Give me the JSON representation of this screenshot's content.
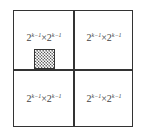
{
  "diagram": {
    "cells": [
      {
        "position": "top-left",
        "base1": "2",
        "exp1": "k−1",
        "times": "×",
        "base2": "2",
        "exp2": "k−1"
      },
      {
        "position": "top-right",
        "base1": "2",
        "exp1": "k−1",
        "times": "×",
        "base2": "2",
        "exp2": "k−1"
      },
      {
        "position": "bottom-left",
        "base1": "2",
        "exp1": "k−1",
        "times": "×",
        "base2": "2",
        "exp2": "k−1"
      },
      {
        "position": "bottom-right",
        "base1": "2",
        "exp1": "k−1",
        "times": "×",
        "base2": "2",
        "exp2": "k−1"
      }
    ],
    "highlight": {
      "pattern": "checkered",
      "location": "top-left quadrant, bottom-left"
    }
  }
}
